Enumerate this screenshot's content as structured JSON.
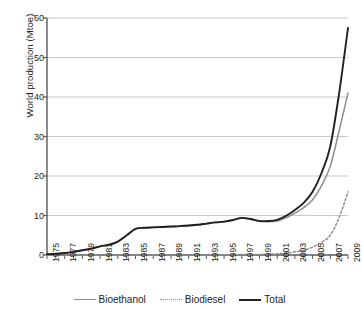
{
  "chart_data": {
    "type": "line",
    "title": "",
    "xlabel": "",
    "ylabel": "World production (Mtoe)",
    "ylim": [
      0,
      60
    ],
    "xlim": [
      1975,
      2009
    ],
    "yticks": [
      0,
      10,
      20,
      30,
      40,
      50,
      60
    ],
    "grid": true,
    "legend_position": "bottom",
    "x": [
      1975,
      1976,
      1977,
      1978,
      1979,
      1980,
      1981,
      1982,
      1983,
      1984,
      1985,
      1986,
      1987,
      1988,
      1989,
      1990,
      1991,
      1992,
      1993,
      1994,
      1995,
      1996,
      1997,
      1998,
      1999,
      2000,
      2001,
      2002,
      2003,
      2004,
      2005,
      2006,
      2007,
      2008,
      2009
    ],
    "series": [
      {
        "name": "Bioethanol",
        "color": "#8d8d8d",
        "style": "solid",
        "values": [
          0.2,
          0.3,
          0.5,
          0.8,
          1.2,
          1.6,
          2.2,
          2.6,
          3.4,
          5.0,
          6.6,
          6.9,
          7.0,
          7.1,
          7.2,
          7.3,
          7.4,
          7.6,
          7.9,
          8.2,
          8.4,
          8.8,
          9.3,
          9.0,
          8.5,
          8.4,
          8.6,
          9.4,
          10.6,
          12.0,
          14.0,
          17.5,
          22.5,
          31.5,
          41.0
        ]
      },
      {
        "name": "Biodiesel",
        "color": "#8d8d8d",
        "style": "dotted",
        "values": [
          0,
          0,
          0,
          0,
          0,
          0,
          0,
          0,
          0,
          0,
          0,
          0,
          0,
          0,
          0,
          0,
          0,
          0,
          0,
          0,
          0.05,
          0.07,
          0.1,
          0.12,
          0.15,
          0.2,
          0.3,
          0.5,
          0.8,
          1.2,
          2.0,
          3.2,
          5.0,
          9.5,
          16.0
        ]
      },
      {
        "name": "Total",
        "color": "#231f20",
        "style": "solid",
        "values": [
          0.2,
          0.3,
          0.5,
          0.8,
          1.2,
          1.6,
          2.2,
          2.6,
          3.4,
          5.0,
          6.6,
          6.9,
          7.0,
          7.1,
          7.2,
          7.3,
          7.45,
          7.65,
          7.95,
          8.25,
          8.45,
          8.87,
          9.4,
          9.12,
          8.65,
          8.6,
          8.9,
          9.9,
          11.4,
          13.2,
          16.0,
          20.7,
          27.5,
          41.0,
          57.5
        ]
      }
    ],
    "xtick_labels": [
      "1975",
      "1977",
      "1979",
      "1981",
      "1983",
      "1985",
      "1987",
      "1989",
      "1991",
      "1993",
      "1995",
      "1997",
      "1999",
      "2001",
      "2003",
      "2005",
      "2007",
      "2009"
    ],
    "legend": [
      {
        "label": "Bioethanol",
        "icon": "line-swatch-solid-gray"
      },
      {
        "label": "Biodiesel",
        "icon": "line-swatch-dotted-gray"
      },
      {
        "label": "Total",
        "icon": "line-swatch-solid-black"
      }
    ],
    "colors": {
      "axis": "#58595b",
      "grid": "#c9c9c9",
      "bioethanol": "#8d8d8d",
      "biodiesel": "#8d8d8d",
      "total": "#231f20",
      "background": "#ffffff"
    }
  }
}
